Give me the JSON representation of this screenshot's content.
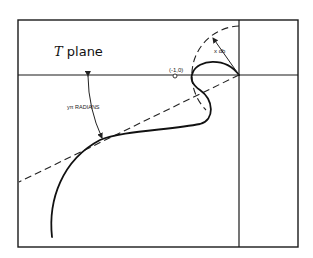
{
  "diagram": {
    "plane_label_italic": "T",
    "plane_label_rest": " plane",
    "point_label": "(-1,0)",
    "gain_margin_label": "x db",
    "phase_margin_label": "yπ RADIANS",
    "colors": {
      "stroke": "#1a1a1a",
      "background": "#ffffff"
    }
  }
}
